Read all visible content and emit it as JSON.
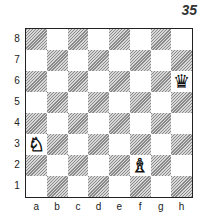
{
  "diagram_number": "35",
  "board": {
    "files": [
      "a",
      "b",
      "c",
      "d",
      "e",
      "f",
      "g",
      "h"
    ],
    "ranks": [
      "8",
      "7",
      "6",
      "5",
      "4",
      "3",
      "2",
      "1"
    ],
    "light_color": "#ffffff",
    "dark_style": "hatched-gray"
  },
  "pieces": [
    {
      "square": "h6",
      "color": "black",
      "type": "queen",
      "glyph": "♛",
      "name": "black-queen-icon"
    },
    {
      "square": "a3",
      "color": "white",
      "type": "knight",
      "glyph": "♘",
      "name": "white-knight-icon"
    },
    {
      "square": "f2",
      "color": "white",
      "type": "bishop",
      "glyph": "♗",
      "name": "white-bishop-icon"
    }
  ]
}
